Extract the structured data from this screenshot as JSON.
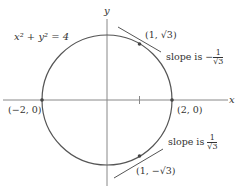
{
  "figure": {
    "equation": "x² + y² = 4",
    "axes": {
      "x_label": "x",
      "y_label": "y"
    },
    "points": [
      {
        "label": "(1, √3)",
        "x": 1,
        "y": 1.732
      },
      {
        "label": "(−2, 0)",
        "x": -2,
        "y": 0
      },
      {
        "label": "(2, 0)",
        "x": 2,
        "y": 0
      },
      {
        "label": "(1, −√3)",
        "x": 1,
        "y": -1.732
      }
    ],
    "annotations": {
      "top_slope_prefix": "slope is −",
      "top_slope_num": "1",
      "top_slope_den": "√3",
      "bottom_slope_prefix": "slope is ",
      "bottom_slope_num": "1",
      "bottom_slope_den": "√3"
    },
    "colors": {
      "circle": "#555555",
      "axes": "#777777",
      "text": "#333333"
    }
  }
}
